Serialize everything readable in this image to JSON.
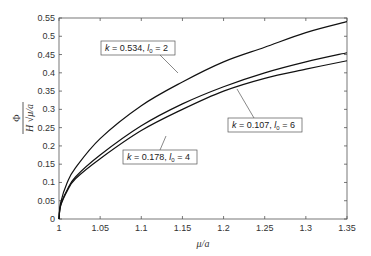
{
  "chart_data": {
    "type": "line",
    "title": "",
    "xlabel": "μ/a",
    "ylabel": "Φ / (H √(μ/a))",
    "ylabel_numerator": "Φ",
    "ylabel_denominator": "H √μ/a",
    "xlim": [
      1,
      1.35
    ],
    "ylim": [
      0,
      0.55
    ],
    "xticks": [
      "1",
      "1.05",
      "1.1",
      "1.15",
      "1.2",
      "1.25",
      "1.3",
      "1.35"
    ],
    "yticks": [
      "0",
      "0.05",
      "0.1",
      "0.15",
      "0.2",
      "0.25",
      "0.3",
      "0.35",
      "0.4",
      "0.45",
      "0.5",
      "0.55"
    ],
    "grid": false,
    "legend": "none (inline annotations)",
    "x": [
      1.0,
      1.002,
      1.01,
      1.02,
      1.05,
      1.1,
      1.15,
      1.2,
      1.25,
      1.3,
      1.35
    ],
    "series": [
      {
        "name": "k = 0.534, l0 = 2",
        "values": [
          0,
          0.045,
          0.1,
          0.14,
          0.22,
          0.31,
          0.375,
          0.43,
          0.47,
          0.51,
          0.54
        ]
      },
      {
        "name": "k = 0.178, l0 = 4",
        "values": [
          0,
          0.038,
          0.08,
          0.115,
          0.175,
          0.255,
          0.315,
          0.362,
          0.4,
          0.43,
          0.455
        ]
      },
      {
        "name": "k = 0.107, l0 = 6",
        "values": [
          0,
          0.036,
          0.077,
          0.11,
          0.165,
          0.242,
          0.3,
          0.35,
          0.385,
          0.41,
          0.433
        ]
      }
    ],
    "annotations": [
      {
        "text_k": "k = 0.534, ",
        "text_l": "l",
        "sub": "0",
        "text_end": " = 2",
        "series": 0
      },
      {
        "text_k": "k = 0.178, ",
        "text_l": "l",
        "sub": "0",
        "text_end": " = 4",
        "series": 1
      },
      {
        "text_k": "k = 0.107, ",
        "text_l": "l",
        "sub": "0",
        "text_end": " = 6",
        "series": 2
      }
    ]
  }
}
